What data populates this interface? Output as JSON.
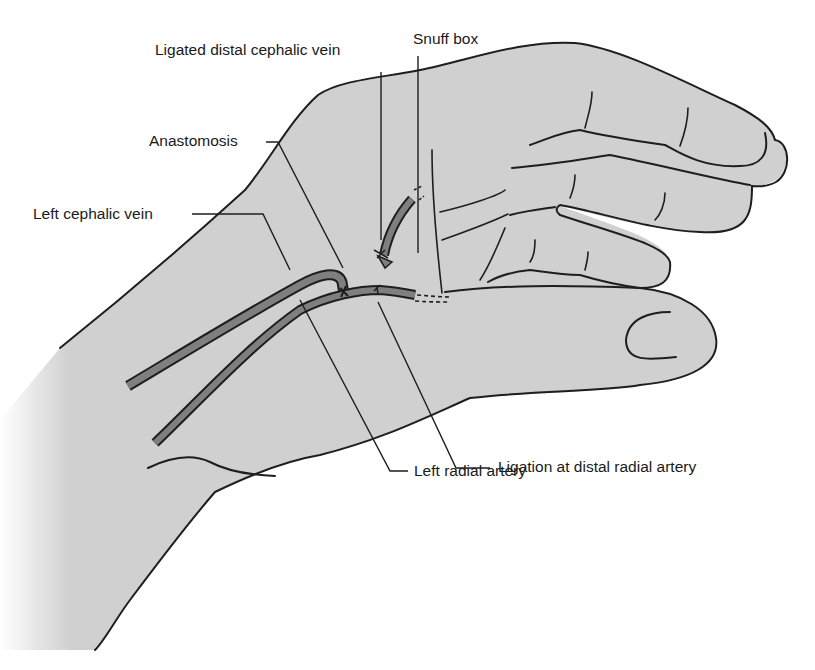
{
  "figure": {
    "colors": {
      "background": "#ffffff",
      "tissue_fill": "#d0d0d0",
      "vessel_fill": "#7f7f7f",
      "outline": "#1e1e1e"
    }
  },
  "labels": {
    "ligated_distal_cephalic_vein": "Ligated distal cephalic vein",
    "snuff_box": "Snuff box",
    "anastomosis": "Anastomosis",
    "left_cephalic_vein": "Left cephalic vein",
    "ligation_distal_radial_artery": "Ligation at distal radial artery",
    "left_radial_artery": "Left radial artery"
  }
}
